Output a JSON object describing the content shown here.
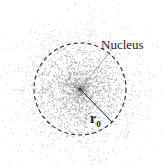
{
  "diagram": {
    "title": "",
    "labels": {
      "nucleus": "Nucleus",
      "radius_symbol": "r",
      "radius_subscript": "0"
    },
    "geometry": {
      "center": [
        80,
        89
      ],
      "radius": 46,
      "leader_line_end": [
        113,
        48
      ],
      "radius_line_end": [
        112,
        122
      ]
    },
    "colors": {
      "dots": "#8a8a8a",
      "circle": "#333333",
      "text": "#222222",
      "background": "#ffffff"
    }
  }
}
